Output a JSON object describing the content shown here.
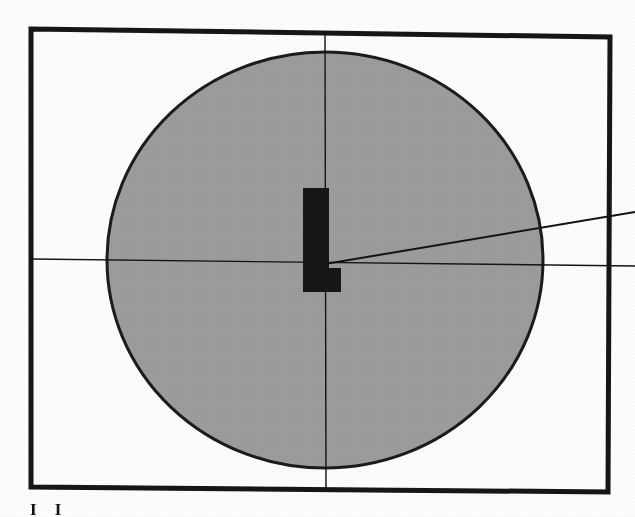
{
  "document": {
    "kind": "scanned-figure",
    "caption_fragment": "I I"
  },
  "colors": {
    "ink": "#141414",
    "ellipse_fill": "#9c9c9c",
    "ellipse_stroke": "#1a1a1a",
    "page_background": "#fdfdfd",
    "glyph_fill": "#121212"
  },
  "figure": {
    "frame": {
      "label": "figure-border",
      "top_left": [
        31,
        29
      ],
      "top_right": [
        610,
        37
      ],
      "bottom_right": [
        608,
        492
      ],
      "bottom_left": [
        31,
        487
      ],
      "stroke_width": 5
    },
    "ellipse": {
      "label": "shaded-ellipse",
      "center": [
        325,
        260
      ],
      "radius_x": 218,
      "radius_y": 208,
      "stroke_width": 3
    },
    "axis_vertical": {
      "label": "vertical-axis-line",
      "x1": 325,
      "y1": 31,
      "x2": 326,
      "y2": 490,
      "stroke_width": 1.4
    },
    "axis_horizontal": {
      "label": "horizontal-axis-line",
      "x1": 31,
      "y1": 259,
      "x2": 635,
      "y2": 266,
      "stroke_width": 1.4
    },
    "ray_angled": {
      "label": "angled-ray-line",
      "x1": 325,
      "y1": 264,
      "x2": 635,
      "y2": 212,
      "stroke_width": 2.0
    },
    "glyph_l": {
      "label": "letter-L-marker",
      "stem_x": 303,
      "stem_y": 188,
      "stem_width": 26,
      "stem_height": 104,
      "foot_x": 303,
      "foot_y": 268,
      "foot_width": 38,
      "foot_height": 24
    }
  },
  "chart_data": {
    "type": "scatter",
    "title": "",
    "xlabel": "",
    "ylabel": "",
    "annotations": [
      {
        "text": "L",
        "x": 325,
        "y": 240,
        "role": "center-marker"
      }
    ],
    "shapes": [
      {
        "type": "rect",
        "role": "border",
        "x": 31,
        "y": 29,
        "width": 578,
        "height": 460,
        "fill": "none",
        "stroke": "#141414"
      },
      {
        "type": "ellipse",
        "role": "shaded-region",
        "cx": 325,
        "cy": 260,
        "rx": 218,
        "ry": 208,
        "fill": "#9c9c9c",
        "stroke": "#1a1a1a"
      },
      {
        "type": "line",
        "role": "vertical-axis",
        "x1": 325,
        "y1": 31,
        "x2": 326,
        "y2": 490,
        "stroke": "#141414"
      },
      {
        "type": "line",
        "role": "horizontal-axis",
        "x1": 31,
        "y1": 259,
        "x2": 635,
        "y2": 266,
        "stroke": "#141414"
      },
      {
        "type": "line",
        "role": "angled-ray",
        "x1": 325,
        "y1": 264,
        "x2": 635,
        "y2": 212,
        "stroke": "#141414"
      }
    ],
    "grid": false,
    "legend": null
  }
}
